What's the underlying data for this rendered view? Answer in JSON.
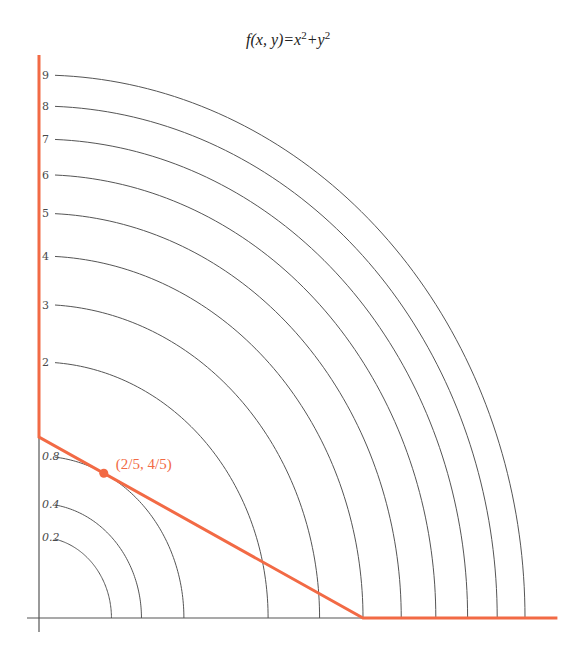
{
  "title": {
    "func": "f",
    "args": "(x, y)",
    "eq": "=x",
    "sup1": "2",
    "plus": "+y",
    "sup2": "2"
  },
  "colors": {
    "constraint": "#f26a45",
    "contour": "#555555",
    "axis": "#555555"
  },
  "chart_data": {
    "type": "contour",
    "function": "f(x, y) = x^2 + y^2",
    "x_range": [
      0,
      3.1
    ],
    "y_range": [
      0,
      3.0
    ],
    "contour_levels": [
      {
        "value": 0.2,
        "label": "0.2",
        "italic": true
      },
      {
        "value": 0.4,
        "label": "0.4",
        "italic": true
      },
      {
        "value": 0.8,
        "label": "0.8",
        "italic": true
      },
      {
        "value": 2,
        "label": "2",
        "italic": false
      },
      {
        "value": 3,
        "label": "3",
        "italic": false
      },
      {
        "value": 4,
        "label": "4",
        "italic": false
      },
      {
        "value": 5,
        "label": "5",
        "italic": false
      },
      {
        "value": 6,
        "label": "6",
        "italic": false
      },
      {
        "value": 7,
        "label": "7",
        "italic": false
      },
      {
        "value": 8,
        "label": "8",
        "italic": false
      },
      {
        "value": 9,
        "label": "9",
        "italic": false
      }
    ],
    "constraint": {
      "description": "boundary of feasible region: x = 0 (y >= 1), x + 2y = 2, y = 0 (x >= 2)",
      "points": [
        [
          0,
          3.1
        ],
        [
          0,
          1
        ],
        [
          2,
          0
        ],
        [
          3.2,
          0
        ]
      ]
    },
    "optimum": {
      "x": 0.4,
      "y": 0.8,
      "label": "(2/5, 4/5)"
    }
  }
}
